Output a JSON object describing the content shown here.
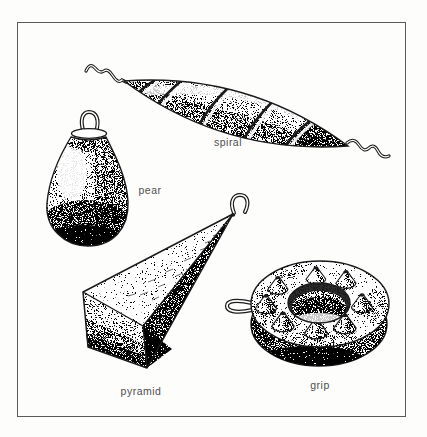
{
  "figure": {
    "ink_color": "#1a1a1a",
    "paper_color": "#fdfdfc",
    "frame_color": "#5a5a5a",
    "label_color": "#4f4f4f",
    "labels": {
      "spiral": "spiral",
      "pear": "pear",
      "pyramid": "pyramid",
      "grip": "grip"
    }
  }
}
